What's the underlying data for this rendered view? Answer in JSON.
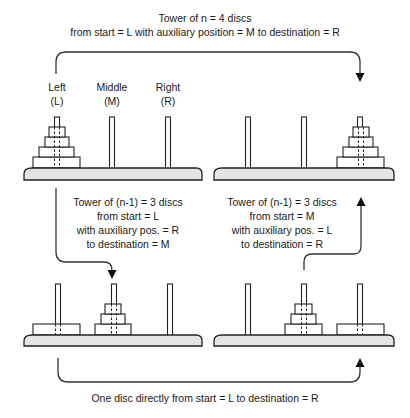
{
  "title": {
    "line1": "Tower of n = 4 discs",
    "line2": "from start = L  with auxiliary position = M  to destination = R"
  },
  "peg_labels": [
    {
      "name": "Left",
      "abbr": "(L)"
    },
    {
      "name": "Middle",
      "abbr": "(M)"
    },
    {
      "name": "Right",
      "abbr": "(R)"
    }
  ],
  "step1": {
    "line1": "Tower of (n-1) = 3 discs",
    "line2": "from start = L",
    "line3": "with auxiliary pos. = R",
    "line4": "to destination = M"
  },
  "step3": {
    "line1": "Tower of (n-1) = 3 discs",
    "line2": "from start = M",
    "line3": "with auxiliary pos. = L",
    "line4": "to destination = R"
  },
  "step2": {
    "line1": "One disc directly from start = L  to destination = R"
  },
  "panels": [
    {
      "id": "initial",
      "position": "top-left",
      "discs": {
        "L": 4,
        "M": 0,
        "R": 0
      }
    },
    {
      "id": "final",
      "position": "top-right",
      "discs": {
        "L": 0,
        "M": 0,
        "R": 4
      }
    },
    {
      "id": "after-step1",
      "position": "bottom-left",
      "discs": {
        "L": 1,
        "M": 3,
        "R": 0
      }
    },
    {
      "id": "after-step2",
      "position": "bottom-right",
      "discs": {
        "L": 0,
        "M": 3,
        "R": 1
      }
    }
  ],
  "colors": {
    "stroke": "#222222",
    "base_fill": "#e4e4e4",
    "text": "#1a1a1a"
  }
}
